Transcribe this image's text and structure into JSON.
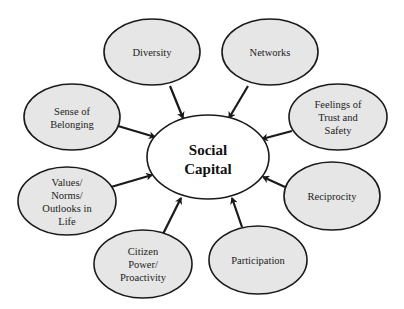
{
  "diagram": {
    "type": "concept-map",
    "center": {
      "id": "social-capital",
      "lines": [
        "Social",
        "Capital"
      ]
    },
    "nodes": [
      {
        "id": "diversity",
        "lines": [
          "Diversity"
        ],
        "relation": "points-to-center"
      },
      {
        "id": "networks",
        "lines": [
          "Networks"
        ],
        "relation": "points-to-center"
      },
      {
        "id": "feelings-of-trust-and-safety",
        "lines": [
          "Feelings of",
          "Trust and",
          "Safety"
        ],
        "relation": "points-to-center"
      },
      {
        "id": "reciprocity",
        "lines": [
          "Reciprocity"
        ],
        "relation": "points-to-center"
      },
      {
        "id": "participation",
        "lines": [
          "Participation"
        ],
        "relation": "points-to-center"
      },
      {
        "id": "citizen-power-proactivity",
        "lines": [
          "Citizen",
          "Power/",
          "Proactivity"
        ],
        "relation": "points-to-center"
      },
      {
        "id": "values-norms-outlooks",
        "lines": [
          "Values/",
          "Norms/",
          "Outlooks in",
          "Life"
        ],
        "relation": "points-to-center"
      },
      {
        "id": "sense-of-belonging",
        "lines": [
          "Sense of",
          "Belonging"
        ],
        "relation": "points-to-center"
      }
    ],
    "colors": {
      "node_fill": "#e6e6e6",
      "center_fill": "#ffffff",
      "stroke": "#1a1a1a"
    }
  }
}
